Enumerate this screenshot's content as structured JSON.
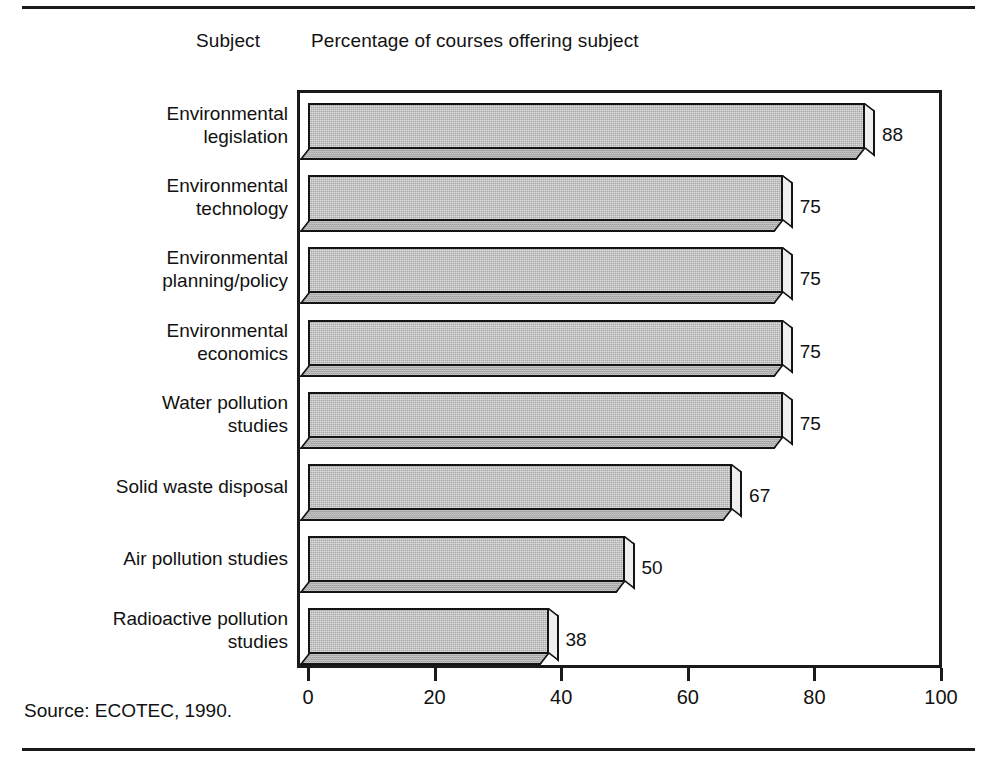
{
  "header": {
    "subject_label": "Subject",
    "measure_label": "Percentage of courses offering subject"
  },
  "source": {
    "text": "Source: ECOTEC, 1990."
  },
  "colors": {
    "bar_fill": "#a9a9a9",
    "bar_outline": "#141414",
    "bar_bottom_face": "#9d9d9d",
    "bar_side_face": "#efefef",
    "frame": "#1a1a1a",
    "text": "#111111",
    "background": "#ffffff"
  },
  "chart_data": {
    "type": "bar",
    "orientation": "horizontal",
    "title": "Percentage of courses offering subject",
    "xlabel": "",
    "ylabel": "Subject",
    "xlim": [
      0,
      100
    ],
    "xticks": [
      0,
      20,
      40,
      60,
      80,
      100
    ],
    "grid": false,
    "legend": false,
    "style": "3d-shaded-bars",
    "categories": [
      "Environmental\nlegislation",
      "Environmental\ntechnology",
      "Environmental\nplanning/policy",
      "Environmental\neconomics",
      "Water pollution\nstudies",
      "Solid waste disposal",
      "Air pollution studies",
      "Radioactive pollution\nstudies"
    ],
    "values": [
      88,
      75,
      75,
      75,
      75,
      67,
      50,
      38
    ],
    "value_labels": [
      "88",
      "75",
      "75",
      "75",
      "75",
      "67",
      "50",
      "38"
    ]
  }
}
